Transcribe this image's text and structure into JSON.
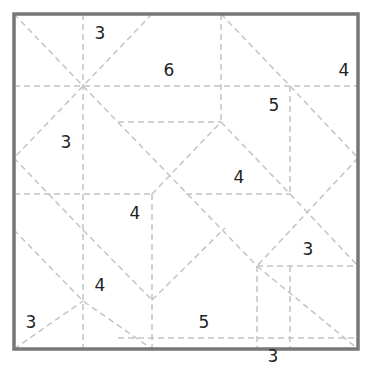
{
  "puzzle": {
    "border_color": "#777777",
    "line_color": "#c4c4c4",
    "clues": [
      {
        "value": "3",
        "x": 100,
        "y": 33
      },
      {
        "value": "6",
        "x": 169,
        "y": 70
      },
      {
        "value": "4",
        "x": 344,
        "y": 70
      },
      {
        "value": "5",
        "x": 274,
        "y": 105
      },
      {
        "value": "3",
        "x": 66,
        "y": 142
      },
      {
        "value": "4",
        "x": 239,
        "y": 177
      },
      {
        "value": "4",
        "x": 135,
        "y": 213
      },
      {
        "value": "3",
        "x": 308,
        "y": 249
      },
      {
        "value": "4",
        "x": 100,
        "y": 285
      },
      {
        "value": "3",
        "x": 31,
        "y": 322
      },
      {
        "value": "5",
        "x": 204,
        "y": 322
      },
      {
        "value": "3",
        "x": 273,
        "y": 356
      }
    ]
  }
}
